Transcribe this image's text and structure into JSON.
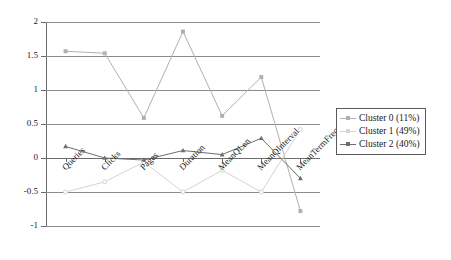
{
  "chart_data": {
    "type": "line",
    "title": "",
    "xlabel": "",
    "ylabel": "",
    "categories": [
      "Queries",
      "Clicks",
      "Pages",
      "Duration",
      "MeanQLen",
      "MeanQInterval",
      "MeanTermFreq"
    ],
    "ylim": [
      -1,
      2
    ],
    "yticks": [
      "2",
      "1.5",
      "1",
      "0.5",
      "0",
      "-0.5",
      "-1"
    ],
    "ytick_values": [
      2,
      1.5,
      1,
      0.5,
      0,
      -0.5,
      -1
    ],
    "grid": true,
    "legend_position": "right",
    "series": [
      {
        "name": "Cluster 0 (11%)",
        "color": "#b0b0b0",
        "marker": "square",
        "values": [
          1.57,
          1.54,
          0.59,
          1.86,
          0.62,
          1.19,
          -0.78
        ]
      },
      {
        "name": "Cluster 1 (49%)",
        "color": "#d4d4d4",
        "marker": "circle",
        "values": [
          -0.5,
          -0.35,
          -0.06,
          -0.5,
          -0.18,
          -0.5,
          0.42
        ]
      },
      {
        "name": "Cluster 2 (40%)",
        "color": "#6e6e6e",
        "marker": "triangle",
        "values": [
          0.17,
          0.0,
          -0.03,
          0.11,
          0.05,
          0.29,
          -0.3
        ]
      }
    ]
  },
  "legend": {
    "entries": [
      {
        "label": "Cluster 0 (11%)"
      },
      {
        "label": "Cluster 1 (49%)"
      },
      {
        "label": "Cluster 2 (40%)"
      }
    ]
  },
  "colors": {
    "series_0": "#b0b0b0",
    "series_1": "#d4d4d4",
    "series_2": "#6e6e6e",
    "grid": "#8c8c8c",
    "axis": "#6b6b6b",
    "text": "#1a1a1a",
    "background": "#ffffff"
  }
}
